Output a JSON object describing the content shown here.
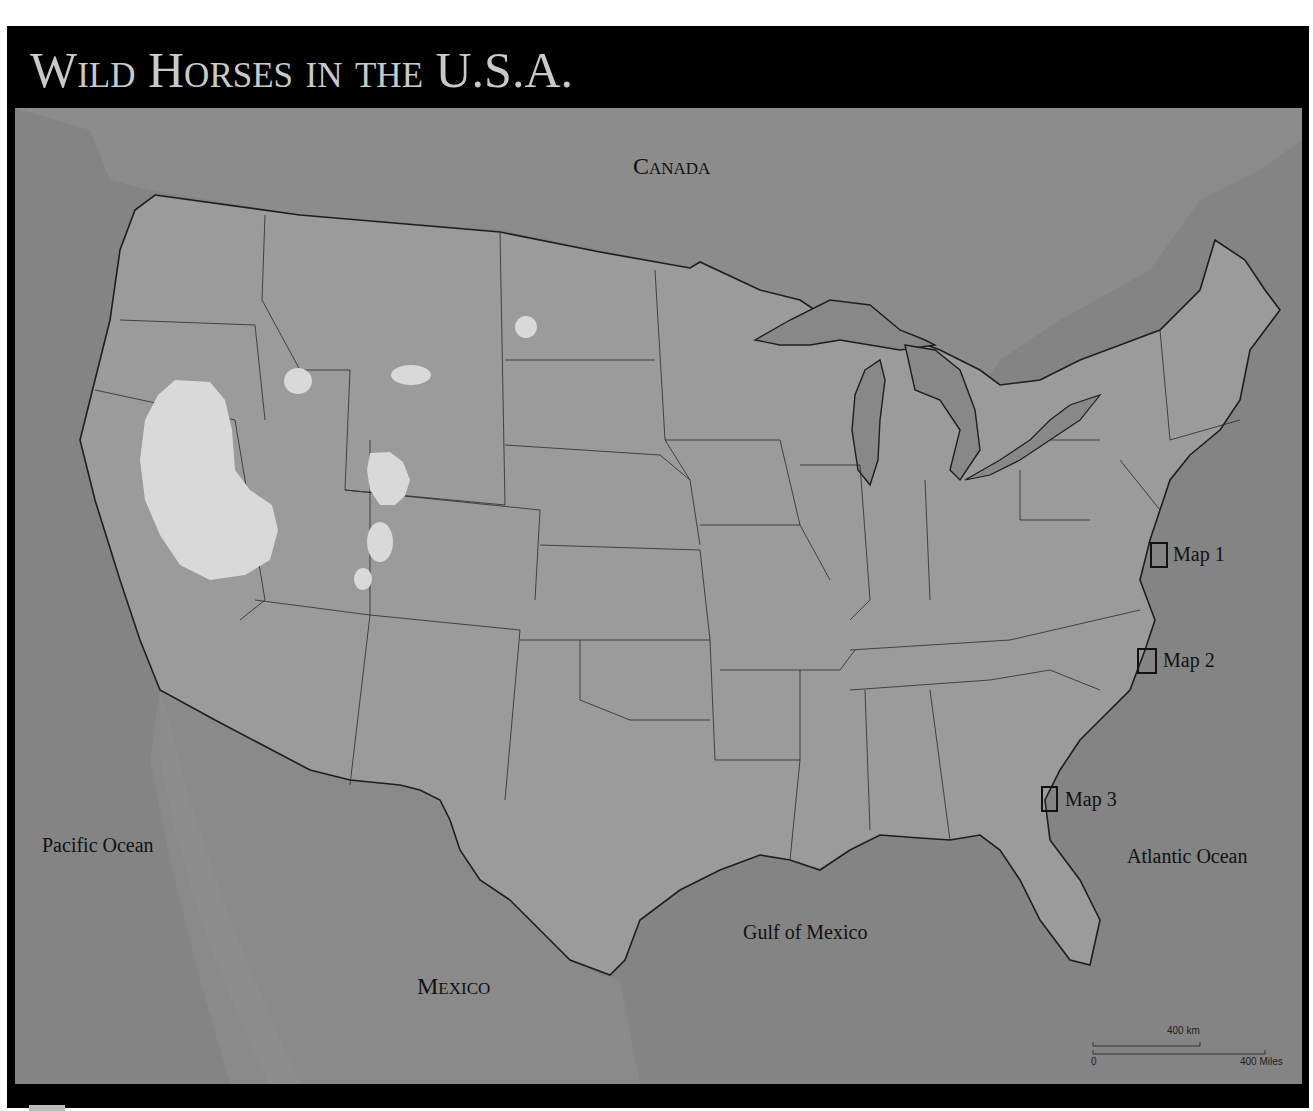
{
  "title": "Wild Horses in the U.S.A.",
  "labels": {
    "canada": "Canada",
    "mexico": "Mexico",
    "pacific": "Pacific Ocean",
    "atlantic": "Atlantic Ocean",
    "gulf": "Gulf of Mexico"
  },
  "map_links": [
    {
      "label": "Map 1"
    },
    {
      "label": "Map 2"
    },
    {
      "label": "Map 3"
    }
  ],
  "scale": {
    "km_label": "400 km",
    "zero_label": "0",
    "miles_label": "400 Miles"
  },
  "colors": {
    "frame": "#000000",
    "title_text": "#c9c9c9",
    "us_land": "#9b9b9b",
    "foreign_land": "#8a8a8a",
    "water": "#848484",
    "wild_horse_range": "#d9d9d9",
    "borders": "#222222"
  },
  "legend": {
    "wild_horse_range": "Wild horse range (light areas)"
  }
}
